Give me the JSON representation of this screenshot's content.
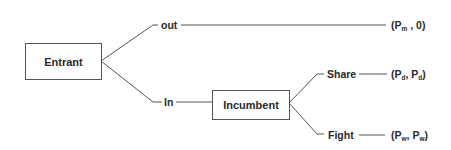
{
  "diagram": {
    "type": "game-tree",
    "nodes": [
      {
        "id": "entrant",
        "label": "Entrant"
      },
      {
        "id": "incumbent",
        "label": "Incumbent"
      }
    ],
    "edges": [
      {
        "from": "entrant",
        "label": "out",
        "to": "payoff_out"
      },
      {
        "from": "entrant",
        "label": "In",
        "to": "incumbent"
      },
      {
        "from": "incumbent",
        "label": "Share",
        "to": "payoff_share"
      },
      {
        "from": "incumbent",
        "label": "Fight",
        "to": "payoff_fight"
      }
    ],
    "payoffs": {
      "out": {
        "p1": "P",
        "p1_sub": "m",
        "p2": "0",
        "p2_sub": ""
      },
      "share": {
        "p1": "P",
        "p1_sub": "d",
        "p2": "P",
        "p2_sub": "d"
      },
      "fight": {
        "p1": "P",
        "p1_sub": "w",
        "p2": "P",
        "p2_sub": "w"
      }
    },
    "colors": {
      "line": "#555555",
      "text": "#2a2a2a",
      "background": "#ffffff"
    }
  }
}
